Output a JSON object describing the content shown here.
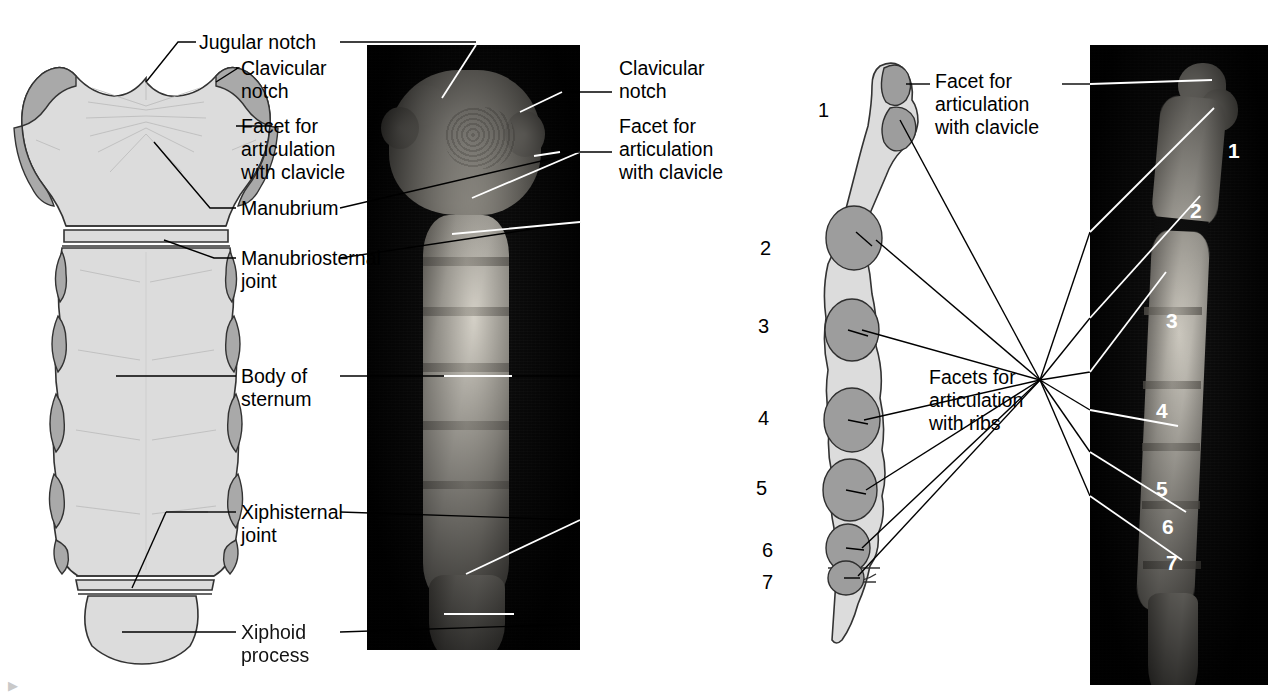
{
  "figure": {
    "background_color": "#ffffff",
    "bone_fill_color": "#dcdcdc",
    "facet_color": "#a9a9a9",
    "photo_background_color": "#030303",
    "bone_photo_color": "#b9b5ac"
  },
  "panels": {
    "anterior_drawing": {
      "name": "Anterior view of sternum (line drawing)"
    },
    "anterior_photo": {
      "name": "Anterior view of sternum (photograph)"
    },
    "lateral_drawing": {
      "name": "Lateral view of sternum (line drawing)"
    },
    "lateral_photo": {
      "name": "Lateral view of sternum (photograph)"
    }
  },
  "labels": {
    "jugular_notch": "Jugular notch",
    "clavicular_notch": "Clavicular\nnotch",
    "facet_clavicle": "Facet for\narticulation\nwith clavicle",
    "manubrium": "Manubrium",
    "manubriosternal_joint": "Manubriosternal\njoint",
    "body_of_sternum": "Body of\nsternum",
    "xiphisternal_joint": "Xiphisternal\njoint",
    "xiphoid_process": "Xiphoid\nprocess",
    "clavicular_notch_photo": "Clavicular\nnotch",
    "facet_clavicle_photo": "Facet for\narticulation\nwith clavicle",
    "facet_clavicle_lateral": "Facet for\narticulation\nwith clavicle",
    "facets_ribs": "Facets for\narticulation\nwith ribs"
  },
  "rib_numbers_drawing": [
    "1",
    "2",
    "3",
    "4",
    "5",
    "6",
    "7"
  ],
  "rib_numbers_photo": [
    "1",
    "2",
    "3",
    "4",
    "5",
    "6",
    "7"
  ]
}
